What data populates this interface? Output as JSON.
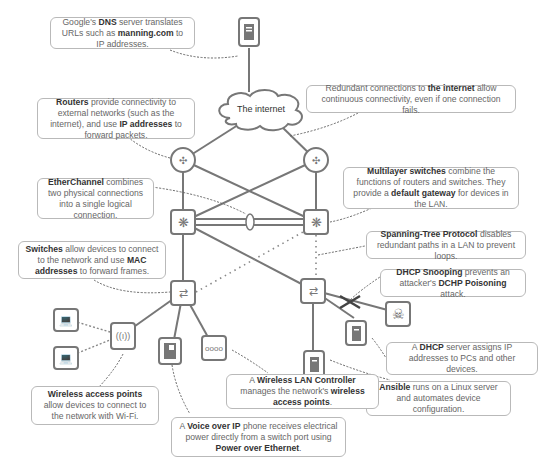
{
  "diagram": {
    "internet_label": "The internet",
    "notes": {
      "dns": {
        "pre": "Google's ",
        "b1": "DNS",
        "mid": " server translates URLs such as ",
        "b2": "manning.com",
        "post": " to IP addresses."
      },
      "redundant": {
        "pre": "Redundant connections to ",
        "b1": "the internet",
        "post": " allow continuous connectivity, even if one connection fails."
      },
      "routers": {
        "b1": "Routers",
        "mid": " provide connectivity to external networks (such as the internet), and use ",
        "b2": "IP addresses",
        "post": " to forward packets."
      },
      "multilayer": {
        "b1": "Multilayer switches",
        "mid": " combine the functions of routers and switches. They provide a ",
        "b2": "default gateway",
        "post": " for devices in the LAN."
      },
      "etherchannel": {
        "b1": "EtherChannel",
        "post": " combines two physical connections into a single logical connection."
      },
      "switches": {
        "b1": "Switches",
        "mid": " allow devices to connect to the network and use ",
        "b2": "MAC addresses",
        "post": " to forward frames."
      },
      "stp": {
        "b1": "Spanning-Tree Protocol",
        "post": " disables redundant paths in a LAN to prevent loops."
      },
      "dhcp_snooping": {
        "b1": "DHCP Snooping",
        "mid": " prevents an attacker's ",
        "b2": "DCHP Poisoning",
        "post": " attack."
      },
      "dhcp_server": {
        "pre": "A ",
        "b1": "DHCP",
        "post": " server assigns IP addresses to PCs and other devices."
      },
      "ansible": {
        "b1": "Ansible",
        "post": " runs on a Linux server and automates device configuration."
      },
      "wlc": {
        "pre": "A ",
        "b1": "Wireless LAN Controller",
        "mid": " manages the network's ",
        "b2": "wireless access points",
        "post": "."
      },
      "wap": {
        "b1": "Wireless access points",
        "post": " allow devices to connect to the network with Wi-Fi."
      },
      "voip": {
        "pre": "A ",
        "b1": "Voice over IP",
        "mid": " phone receives electrical power directly from a switch port using ",
        "b2": "Power over Ethernet",
        "post": "."
      }
    },
    "icons": [
      "dns-server-icon",
      "cloud-icon",
      "router-icon",
      "multilayer-switch-icon",
      "switch-icon",
      "wireless-ap-icon",
      "laptop-icon",
      "ip-phone-icon",
      "wlc-icon",
      "server-icon",
      "skull-icon"
    ],
    "colors": {
      "line": "#777777",
      "border": "#b9b9b9",
      "text": "#666666",
      "bold": "#333333"
    }
  }
}
